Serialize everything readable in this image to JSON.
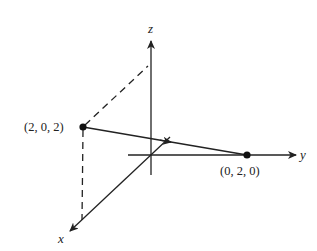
{
  "diagram": {
    "type": "3d-coordinate-axes-with-vector",
    "colors": {
      "ink": "#222222",
      "background": "#ffffff"
    },
    "axes": {
      "x": {
        "label": "x",
        "origin": [
          151,
          155
        ],
        "tip": [
          69,
          232
        ]
      },
      "y": {
        "label": "y",
        "start": [
          128,
          155
        ],
        "tip": [
          296,
          155
        ]
      },
      "z": {
        "label": "z",
        "bottom": [
          151,
          175
        ],
        "tip": [
          151,
          40
        ]
      }
    },
    "points": [
      {
        "label": "(2, 0, 2)",
        "px": [
          83,
          127
        ]
      },
      {
        "label": "(0, 2, 0)",
        "px": [
          247,
          155
        ]
      }
    ],
    "vector": {
      "from": "(2, 0, 2)",
      "to": "(0, 2, 0)",
      "arrow_mid": [
        171,
        142
      ]
    },
    "dashed_lines": [
      {
        "name": "projection-to-z",
        "from": [
          83,
          127
        ],
        "to": [
          148,
          66
        ]
      },
      {
        "name": "projection-to-x",
        "from": [
          83,
          127
        ],
        "to": [
          82,
          220
        ]
      }
    ]
  }
}
